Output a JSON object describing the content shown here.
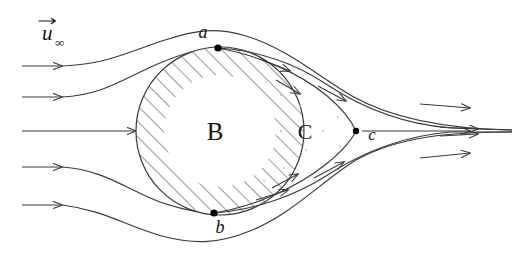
{
  "figure": {
    "background_color": "#ffffff",
    "stroke_color": "#3a3a3a",
    "label_color": "#141414",
    "hatch_color": "#4a4a4a",
    "dot_color": "#000000",
    "wake_stipple_color": "#c9c9c9",
    "width": 520,
    "height": 255
  },
  "labels": {
    "freestream": {
      "text": "u",
      "subscript": "∞",
      "accent": "vector-arrow",
      "x": 42,
      "y": 40
    },
    "body": {
      "text": "B",
      "x": 215,
      "y": 131
    },
    "wake": {
      "text": "C",
      "x": 305,
      "y": 131
    },
    "point_a": {
      "text": "a",
      "x": 203,
      "y": 38
    },
    "point_b": {
      "text": "b",
      "x": 220,
      "y": 233
    },
    "point_c": {
      "text": "c",
      "x": 372,
      "y": 134
    }
  },
  "points": [
    {
      "name": "a",
      "x": 218,
      "y": 48,
      "r": 3.6
    },
    {
      "name": "b",
      "x": 214,
      "y": 213,
      "r": 3.6
    },
    {
      "name": "c",
      "x": 356,
      "y": 131,
      "r": 3.2
    }
  ],
  "body_circle": {
    "cx": 220,
    "cy": 131,
    "r": 84
  },
  "geometry_notes": {
    "hatch_angle_deg": 45,
    "hatch_band": "annulus inside circle boundary",
    "wake_shape": "cusp closing at point c",
    "inflow_streamline_count": 5,
    "outflow_convergence_x": 512
  },
  "streamlines": [
    {
      "name": "inflow-1",
      "y": 66,
      "arrow_x": 62
    },
    {
      "name": "inflow-2",
      "y": 97,
      "arrow_x": 62
    },
    {
      "name": "inflow-3",
      "y": 131,
      "arrow_x": 62
    },
    {
      "name": "inflow-4",
      "y": 167,
      "arrow_x": 62
    },
    {
      "name": "inflow-5",
      "y": 205,
      "arrow_x": 62
    }
  ]
}
